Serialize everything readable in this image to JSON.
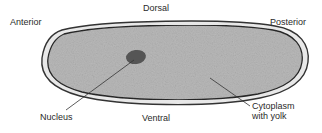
{
  "diagram": {
    "labels": {
      "anterior": "Anterior",
      "dorsal": "Dorsal",
      "posterior": "Posterior",
      "nucleus": "Nucleus",
      "ventral": "Ventral",
      "cytoplasm_line1": "Cytoplasm",
      "cytoplasm_line2": "with yolk"
    },
    "colors": {
      "cytoplasm_fill": "#b9b9b9",
      "outline": "#333333",
      "membrane_gap": "#e8e8e8",
      "nucleus_fill": "#555555",
      "text": "#2a2a2a"
    }
  }
}
